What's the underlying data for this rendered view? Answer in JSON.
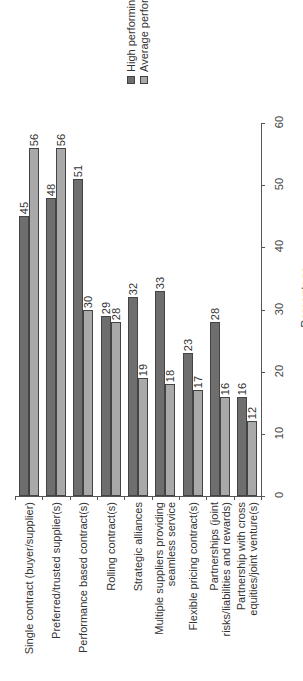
{
  "chart_data": {
    "type": "bar",
    "orientation": "vertical-bars, image rotated 90° (labels read bottom-to-top)",
    "title": "",
    "xlabel": "",
    "ylabel": "Percentage",
    "ylim": [
      0,
      60
    ],
    "yticks": [
      "0",
      "10",
      "20",
      "30",
      "40",
      "50",
      "60"
    ],
    "legend_position": "top-right",
    "categories": [
      "Single contract (buyer/supplier)",
      "Preferred/trusted supplier(s)",
      "Performance based contract(s)",
      "Rolling contract(s)",
      "Strategic alliances",
      "Multiple suppliers providing seamless service",
      "Flexible pricing contract(s)",
      "Partnerships (joint risks/liabilities and rewards)",
      "Partnership with cross equities/joint venture(s)"
    ],
    "series": [
      {
        "name": "High performing",
        "color": "#6e6e6e",
        "values": [
          45,
          48,
          51,
          29,
          32,
          33,
          23,
          28,
          16
        ]
      },
      {
        "name": "Average performing",
        "color": "#a9a9a9",
        "values": [
          56,
          56,
          30,
          28,
          19,
          18,
          17,
          16,
          12
        ]
      }
    ]
  },
  "legend": {
    "high": "High performing",
    "average": "Average performing"
  },
  "axis": {
    "label": "Percentage",
    "ticks": [
      "0",
      "10",
      "20",
      "30",
      "40",
      "50",
      "60"
    ]
  },
  "categories": [
    {
      "line1": "Single contract (buyer/supplier)",
      "line2": "",
      "hi": "45",
      "av": "56"
    },
    {
      "line1": "Preferred/trusted supplier(s)",
      "line2": "",
      "hi": "48",
      "av": "56"
    },
    {
      "line1": "Performance based contract(s)",
      "line2": "",
      "hi": "51",
      "av": "30"
    },
    {
      "line1": "Rolling contract(s)",
      "line2": "",
      "hi": "29",
      "av": "28"
    },
    {
      "line1": "Strategic alliances",
      "line2": "",
      "hi": "32",
      "av": "19"
    },
    {
      "line1": "Multiple suppliers providing",
      "line2": "seamless service",
      "hi": "33",
      "av": "18"
    },
    {
      "line1": "Flexible pricing contract(s)",
      "line2": "",
      "hi": "23",
      "av": "17"
    },
    {
      "line1": "Partnerships (joint",
      "line2": "risks/liabilities and rewards)",
      "hi": "28",
      "av": "16"
    },
    {
      "line1": "Partnership with cross",
      "line2": "equities/joint venture(s)",
      "hi": "16",
      "av": "12"
    }
  ]
}
